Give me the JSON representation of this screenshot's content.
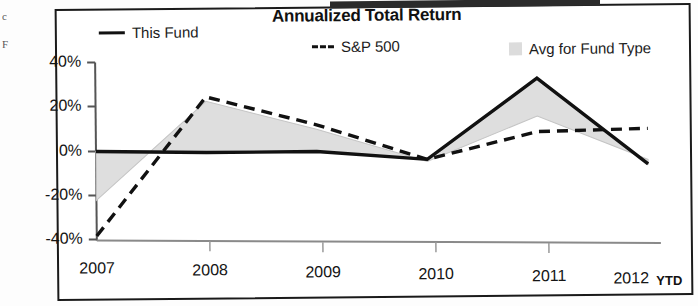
{
  "chart_data": {
    "type": "line",
    "title": "Annualized Total Return",
    "xlabel": "",
    "ylabel": "",
    "x": [
      "2007",
      "2008",
      "2009",
      "2010",
      "2011",
      "2012"
    ],
    "categories": [
      "2007",
      "2008",
      "2009",
      "2010",
      "2011",
      "2012"
    ],
    "ytick_labels": [
      "40%",
      "20%",
      "0%",
      "-20%",
      "-40%"
    ],
    "ytick_values": [
      40,
      20,
      0,
      -20,
      -40
    ],
    "ylim": [
      -40,
      40
    ],
    "grid": false,
    "legend_position": "top",
    "x_axis_note": "YTD",
    "series": [
      {
        "name": "This Fund",
        "style": "solid",
        "color": "#111111",
        "values": [
          0,
          -1,
          -1,
          -5,
          31,
          -8
        ]
      },
      {
        "name": "S&P 500",
        "style": "dashed",
        "color": "#111111",
        "values": [
          -38,
          24,
          11,
          -5,
          7,
          8
        ]
      },
      {
        "name": "Avg for Fund Type",
        "style": "area",
        "color": "#dcdcdc",
        "values": [
          -22,
          22,
          9,
          -6,
          14,
          -6
        ]
      }
    ]
  },
  "legend": {
    "items": [
      {
        "label": "This Fund",
        "marker": "solid-line-swatch"
      },
      {
        "label": "S&P 500",
        "marker": "dashed-line-swatch"
      },
      {
        "label": "Avg for Fund Type",
        "marker": "area-swatch"
      }
    ]
  },
  "axes": {
    "y_labels": [
      "40%",
      "20%",
      "0%",
      "-20%",
      "-40%"
    ],
    "x_labels": [
      "2007",
      "2008",
      "2009",
      "2010",
      "2011",
      "2012"
    ],
    "x_note": "YTD"
  },
  "scan_artifacts": {
    "fragments": [
      "c",
      "F"
    ]
  }
}
